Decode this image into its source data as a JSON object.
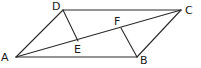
{
  "figure": {
    "type": "parallelogram-with-perpendiculars",
    "stroke_color": "#2a2a2a",
    "label_color": "#1a1a1a",
    "points": {
      "A": {
        "x": 16,
        "y": 57
      },
      "B": {
        "x": 137,
        "y": 57
      },
      "C": {
        "x": 181,
        "y": 10
      },
      "D": {
        "x": 63,
        "y": 10
      },
      "E": {
        "x": 78,
        "y": 41
      },
      "F": {
        "x": 121,
        "y": 28
      }
    },
    "segments": [
      [
        "A",
        "B"
      ],
      [
        "B",
        "C"
      ],
      [
        "C",
        "D"
      ],
      [
        "D",
        "A"
      ],
      [
        "A",
        "C"
      ],
      [
        "D",
        "E"
      ],
      [
        "B",
        "F"
      ]
    ],
    "labels": {
      "A": "A",
      "B": "B",
      "C": "C",
      "D": "D",
      "E": "E",
      "F": "F"
    }
  }
}
